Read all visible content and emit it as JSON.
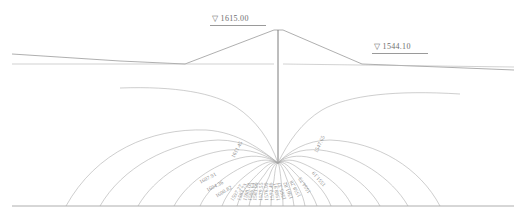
{
  "figure": {
    "type": "contour-section",
    "line_color": "#9a9a9a",
    "text_color": "#8d8d8d",
    "background": "#ffffff"
  },
  "water_levels": [
    {
      "id": "upstream",
      "symbol": "▽",
      "value": "1615.00",
      "label": "▽ 1615.00",
      "x": 212,
      "y": 15
    },
    {
      "id": "downstream",
      "symbol": "▽",
      "value": "1544.10",
      "label": "▽ 1544.10",
      "x": 374,
      "y": 43
    }
  ],
  "contours": [
    {
      "value": "1611.45",
      "x": 233,
      "y": 155,
      "angle": -62
    },
    {
      "value": "1607.91",
      "x": 200,
      "y": 180,
      "angle": -28
    },
    {
      "value": "1604.36",
      "x": 207,
      "y": 188,
      "angle": -27
    },
    {
      "value": "1600.82",
      "x": 216,
      "y": 194,
      "angle": -31
    },
    {
      "value": "1597.27",
      "x": 232,
      "y": 198,
      "angle": -58
    },
    {
      "value": "1593.73",
      "x": 239,
      "y": 198,
      "angle": -68
    },
    {
      "value": "1590.18",
      "x": 245,
      "y": 198,
      "angle": -74
    },
    {
      "value": "1586.64",
      "x": 250,
      "y": 198,
      "angle": -79
    },
    {
      "value": "1583.09",
      "x": 255,
      "y": 198,
      "angle": -84
    },
    {
      "value": "1579.55",
      "x": 261,
      "y": 198,
      "angle": -88
    },
    {
      "value": "1576.00",
      "x": 267,
      "y": 198,
      "angle": -92
    },
    {
      "value": "1572.46",
      "x": 273,
      "y": 198,
      "angle": -97
    },
    {
      "value": "1568.91",
      "x": 279,
      "y": 198,
      "angle": -102
    },
    {
      "value": "1565.37",
      "x": 285,
      "y": 197,
      "angle": -108
    },
    {
      "value": "1561.82",
      "x": 292,
      "y": 196,
      "angle": -113
    },
    {
      "value": "1558.28",
      "x": 300,
      "y": 194,
      "angle": -119
    },
    {
      "value": "1554.73",
      "x": 310,
      "y": 190,
      "angle": -124
    },
    {
      "value": "1551.19",
      "x": 325,
      "y": 183,
      "angle": -130
    },
    {
      "value": "1547.65",
      "x": 316,
      "y": 150,
      "angle": -65
    }
  ],
  "geometry": {
    "crest_label": "dam-crest",
    "cutoff_wall_label": "vertical-cutoff-wall",
    "ground_surface_label": "ground-surface",
    "bedrock_base_label": "impervious-base"
  }
}
